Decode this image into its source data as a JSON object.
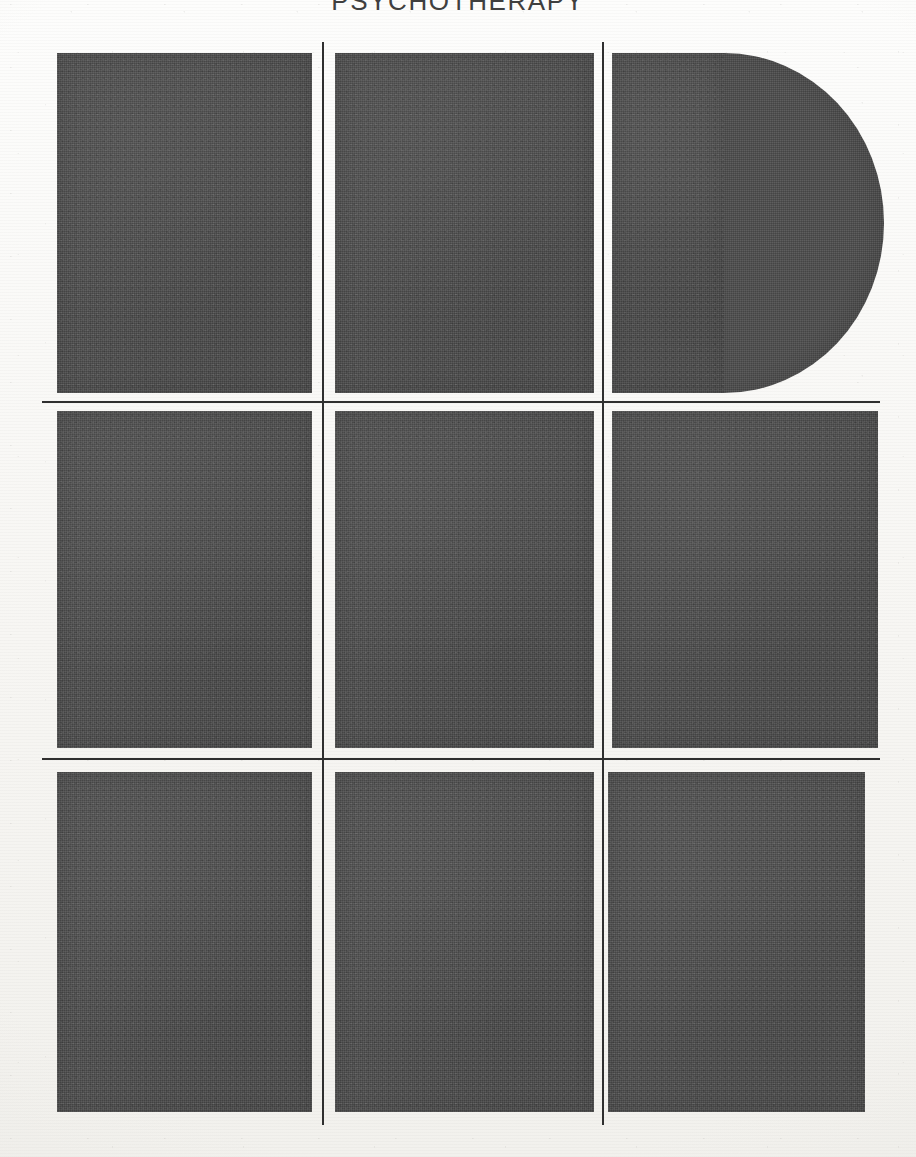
{
  "page": {
    "title_text": "PSYCHOTHERAPY",
    "width_px": 916,
    "height_px": 1157,
    "paper_color": "#f7f6f3",
    "ink_color": "#2f2f2f",
    "plate_fill_color": "#4d4d4d"
  },
  "grid": {
    "columns": 3,
    "rows": 3,
    "column_rule_count": 2,
    "row_rule_count": 2,
    "plate_count": 9
  },
  "plates": [
    {
      "id": "r1c1",
      "row": 1,
      "column": 1,
      "shape": "rectangle",
      "x": 57,
      "y": 53,
      "width": 255,
      "height": 340,
      "fill": "#4d4d4d"
    },
    {
      "id": "r1c2",
      "row": 1,
      "column": 2,
      "shape": "rectangle",
      "x": 335,
      "y": 53,
      "width": 259,
      "height": 340,
      "fill": "#4d4d4d"
    },
    {
      "id": "r1c3",
      "row": 1,
      "column": 3,
      "shape": "d-shape-semicircular-right-bulge",
      "x": 612,
      "y": 53,
      "width": 112,
      "height": 340,
      "bulge_radius_x": 160,
      "fill": "#4d4d4d"
    },
    {
      "id": "r2c1",
      "row": 2,
      "column": 1,
      "shape": "rectangle",
      "x": 57,
      "y": 411,
      "width": 255,
      "height": 337,
      "fill": "#4d4d4d"
    },
    {
      "id": "r2c2",
      "row": 2,
      "column": 2,
      "shape": "rectangle",
      "x": 335,
      "y": 411,
      "width": 259,
      "height": 337,
      "fill": "#4d4d4d"
    },
    {
      "id": "r2c3",
      "row": 2,
      "column": 3,
      "shape": "rectangle",
      "x": 612,
      "y": 411,
      "width": 266,
      "height": 337,
      "fill": "#4d4d4d"
    },
    {
      "id": "r3c1",
      "row": 3,
      "column": 1,
      "shape": "rectangle",
      "x": 57,
      "y": 772,
      "width": 255,
      "height": 340,
      "fill": "#4d4d4d"
    },
    {
      "id": "r3c2",
      "row": 3,
      "column": 2,
      "shape": "rectangle",
      "x": 335,
      "y": 772,
      "width": 259,
      "height": 340,
      "fill": "#4d4d4d"
    },
    {
      "id": "r3c3",
      "row": 3,
      "column": 3,
      "shape": "rectangle",
      "x": 608,
      "y": 772,
      "width": 257,
      "height": 340,
      "fill": "#4d4d4d"
    }
  ],
  "rules": {
    "horizontal": [
      {
        "id": "h1",
        "x": 42,
        "y": 401,
        "length": 838,
        "thickness": 1.6,
        "color": "#2f2f2f"
      },
      {
        "id": "h2",
        "x": 42,
        "y": 758,
        "length": 838,
        "thickness": 1.6,
        "color": "#2f2f2f"
      }
    ],
    "vertical": [
      {
        "id": "v1",
        "x": 322,
        "y": 42,
        "length": 1083,
        "thickness": 1.8,
        "color": "#2f2f2f"
      },
      {
        "id": "v2",
        "x": 602,
        "y": 42,
        "length": 1083,
        "thickness": 1.8,
        "color": "#2f2f2f"
      }
    ]
  }
}
